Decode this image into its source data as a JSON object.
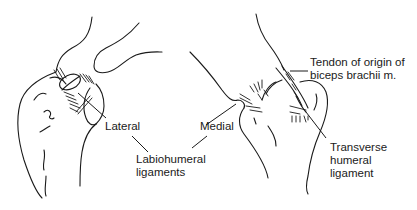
{
  "diagram": {
    "type": "anatomical-line-drawing",
    "stroke_color": "#1a1a1a",
    "background": "#ffffff",
    "views": [
      {
        "id": "left-view",
        "name": "lateral view of shoulder joint"
      },
      {
        "id": "right-view",
        "name": "medial view of shoulder joint"
      }
    ],
    "labels": {
      "lateral": "Lateral",
      "medial": "Medial",
      "labiohumeral_line1": "Labiohumeral",
      "labiohumeral_line2": "ligaments",
      "tendon_line1": "Tendon of origin of",
      "tendon_line2": "biceps brachii m.",
      "transverse_line1": "Transverse",
      "transverse_line2": "humeral",
      "transverse_line3": "ligament"
    }
  }
}
